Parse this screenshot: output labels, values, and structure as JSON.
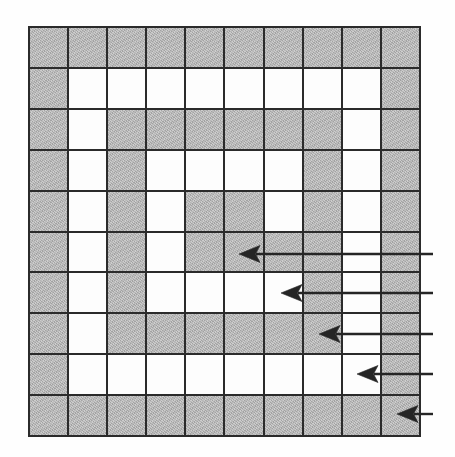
{
  "figure": {
    "grid": {
      "rows": 10,
      "columns": 10,
      "shaded_color": "#b3b3b3",
      "open_color": "#fdfdfd",
      "line_color": "#2b2b2b",
      "legend": {
        "shaded_label": "shaded",
        "open_label": "open"
      },
      "cells": [
        [
          "shaded",
          "shaded",
          "shaded",
          "shaded",
          "shaded",
          "shaded",
          "shaded",
          "shaded",
          "shaded",
          "shaded"
        ],
        [
          "shaded",
          "open",
          "open",
          "open",
          "open",
          "open",
          "open",
          "open",
          "open",
          "shaded"
        ],
        [
          "shaded",
          "open",
          "shaded",
          "shaded",
          "shaded",
          "shaded",
          "shaded",
          "shaded",
          "open",
          "shaded"
        ],
        [
          "shaded",
          "open",
          "shaded",
          "open",
          "open",
          "open",
          "open",
          "shaded",
          "open",
          "shaded"
        ],
        [
          "shaded",
          "open",
          "shaded",
          "open",
          "shaded",
          "shaded",
          "open",
          "shaded",
          "open",
          "shaded"
        ],
        [
          "shaded",
          "open",
          "shaded",
          "open",
          "shaded",
          "shaded",
          "shaded",
          "shaded",
          "open",
          "shaded"
        ],
        [
          "shaded",
          "open",
          "shaded",
          "open",
          "open",
          "open",
          "open",
          "shaded",
          "open",
          "shaded"
        ],
        [
          "shaded",
          "open",
          "shaded",
          "shaded",
          "shaded",
          "shaded",
          "shaded",
          "shaded",
          "open",
          "shaded"
        ],
        [
          "shaded",
          "open",
          "open",
          "open",
          "open",
          "open",
          "open",
          "open",
          "open",
          "shaded"
        ],
        [
          "shaded",
          "shaded",
          "shaded",
          "shaded",
          "shaded",
          "shaded",
          "shaded",
          "shaded",
          "shaded",
          "shaded"
        ]
      ]
    },
    "arrows": {
      "count": 5,
      "color": "#252525",
      "direction": "left",
      "items": [
        {
          "id": "arrow-1",
          "tip_x": 239,
          "tip_y": 254,
          "tail_x": 433,
          "target_row": 6,
          "target_col": 6
        },
        {
          "id": "arrow-2",
          "tip_x": 281,
          "tip_y": 293,
          "tail_x": 433,
          "target_row": 7,
          "target_col": 7
        },
        {
          "id": "arrow-3",
          "tip_x": 319,
          "tip_y": 334,
          "tail_x": 433,
          "target_row": 8,
          "target_col": 8
        },
        {
          "id": "arrow-4",
          "tip_x": 357,
          "tip_y": 374,
          "tail_x": 433,
          "target_row": 9,
          "target_col": 9
        },
        {
          "id": "arrow-5",
          "tip_x": 397,
          "tip_y": 414,
          "tail_x": 433,
          "target_row": 10,
          "target_col": 10
        }
      ]
    }
  }
}
